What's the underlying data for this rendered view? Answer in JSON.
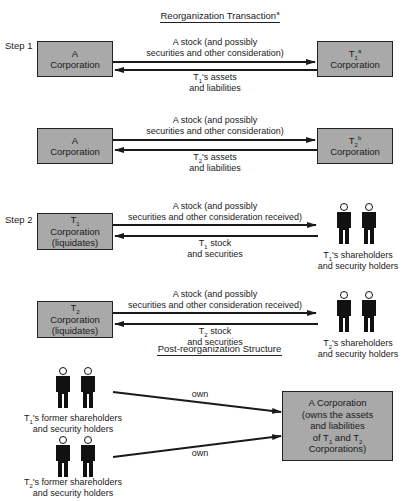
{
  "sections": {
    "top_title": "Reorganization Transaction",
    "top_title_note": "a",
    "bottom_title": "Post-reorganization Structure"
  },
  "steps": {
    "step1": "Step 1",
    "step2": "Step 2"
  },
  "step1": {
    "row1": {
      "left_box": {
        "line1": "A",
        "line2": "Corporation"
      },
      "right_box": {
        "line1": "T",
        "sub": "1",
        "sup": "a",
        "line2": "Corporation"
      },
      "top_arrow": {
        "line1": "A stock (and possibly",
        "line2": "securities and other consideration)"
      },
      "bottom_arrow": {
        "prefix": "T",
        "sub": "1",
        "line1_rest": "'s assets",
        "line2": "and liabilities"
      }
    },
    "row2": {
      "left_box": {
        "line1": "A",
        "line2": "Corporation"
      },
      "right_box": {
        "line1": "T",
        "sub": "2",
        "sup": "b",
        "line2": "Corporation"
      },
      "top_arrow": {
        "line1": "A stock (and possibly",
        "line2": "securities and other consideration)"
      },
      "bottom_arrow": {
        "prefix": "T",
        "sub": "2",
        "line1_rest": "'s assets",
        "line2": "and liabilities"
      }
    }
  },
  "step2": {
    "row1": {
      "left_box": {
        "line1": "T",
        "sub": "1",
        "line2": "Corporation",
        "line3": "(liquidates)"
      },
      "top_arrow": {
        "line1": "A stock (and possibly",
        "line2": "securities and other consideration received)"
      },
      "bottom_arrow": {
        "prefix": "T",
        "sub": "1",
        "line1_rest": " stock",
        "line2": "and securities"
      },
      "holders": {
        "prefix": "T",
        "sub": "1",
        "line1_rest": "'s shareholders",
        "line2": "and security holders"
      }
    },
    "row2": {
      "left_box": {
        "line1": "T",
        "sub": "2",
        "line2": "Corporation",
        "line3": "(liquidates)"
      },
      "top_arrow": {
        "line1": "A stock (and possibly",
        "line2": "securities and other consideration received)"
      },
      "bottom_arrow": {
        "prefix": "T",
        "sub": "2",
        "line1_rest": " stock",
        "line2": "and securities"
      },
      "holders": {
        "prefix": "T",
        "sub": "2",
        "line1_rest": "'s shareholders",
        "line2": "and security holders"
      }
    }
  },
  "post": {
    "holders1": {
      "prefix": "T",
      "sub": "1",
      "line1_rest": "'s former shareholders",
      "line2": "and security holders"
    },
    "holders2": {
      "prefix": "T",
      "sub": "2",
      "line1_rest": "'s former shareholders",
      "line2": "and security holders"
    },
    "arrow1_label": "own",
    "arrow2_label": "own",
    "result_box": {
      "line1": "A Corporation",
      "line2": "(owns the assets",
      "line3": "and liabilities",
      "line4_a": "of T",
      "line4_sub1": "1",
      "line4_b": " and T",
      "line4_sub2": "2",
      "line5": "Corporations)"
    }
  },
  "colors": {
    "box_fill": "#a9a9a9",
    "line": "#1a1a1a",
    "figure": "#111111"
  }
}
